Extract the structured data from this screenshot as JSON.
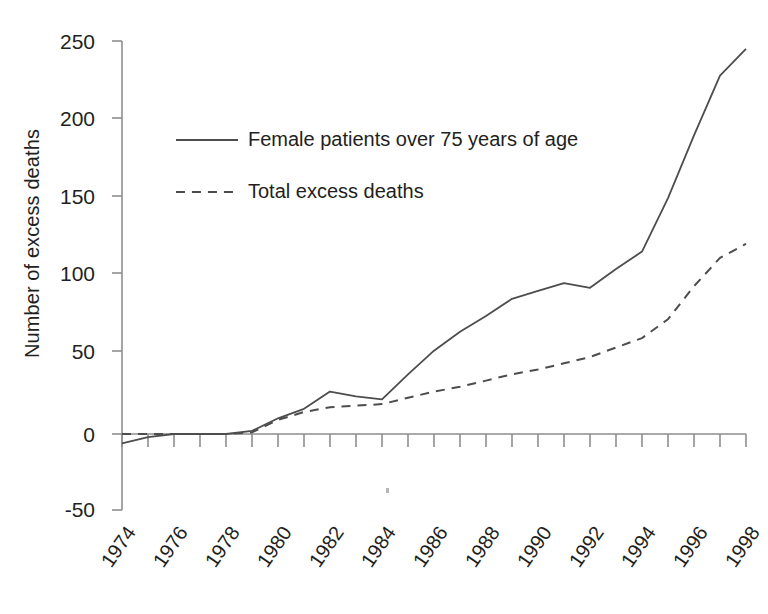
{
  "chart_data": {
    "type": "line",
    "title": "",
    "xlabel": "",
    "ylabel": "Number of excess deaths",
    "xlim": [
      1973,
      1999
    ],
    "ylim": [
      -50,
      250
    ],
    "yticks": [
      -50,
      0,
      50,
      100,
      150,
      200,
      250
    ],
    "xticks": [
      1974,
      1976,
      1978,
      1980,
      1982,
      1984,
      1986,
      1988,
      1990,
      1992,
      1994,
      1996,
      1998
    ],
    "x": [
      1974,
      1975,
      1976,
      1977,
      1978,
      1979,
      1980,
      1981,
      1982,
      1983,
      1984,
      1985,
      1986,
      1987,
      1988,
      1989,
      1990,
      1991,
      1992,
      1993,
      1994,
      1995,
      1996,
      1997,
      1998
    ],
    "grid": false,
    "legend_position": "upper-left-inside",
    "series": [
      {
        "name": "Female patients over 75 years of age",
        "style": "solid",
        "color": "#4d4d4d",
        "values": [
          -6,
          -2,
          0,
          0,
          0,
          2,
          10,
          16,
          27,
          24,
          22,
          38,
          53,
          65,
          75,
          86,
          91,
          96,
          93,
          105,
          116,
          150,
          190,
          228,
          245
        ]
      },
      {
        "name": "Total excess deaths",
        "style": "dashed",
        "color": "#4d4d4d",
        "values": [
          0,
          0,
          0,
          0,
          0,
          1,
          9,
          14,
          17,
          18,
          19,
          23,
          27,
          30,
          34,
          38,
          41,
          45,
          49,
          55,
          61,
          73,
          94,
          112,
          121
        ]
      }
    ]
  },
  "axis": {
    "y_tick_labels": [
      "250",
      "200",
      "150",
      "100",
      "50",
      "0",
      "-50"
    ],
    "x_tick_labels": [
      "1974",
      "1976",
      "1978",
      "1980",
      "1982",
      "1984",
      "1986",
      "1988",
      "1990",
      "1992",
      "1994",
      "1996",
      "1998"
    ],
    "y_axis_title": "Number of excess deaths"
  },
  "legend": {
    "entries": [
      {
        "label": "Female patients over 75 years of age",
        "style": "solid"
      },
      {
        "label": "Total excess deaths",
        "style": "dashed"
      }
    ]
  }
}
